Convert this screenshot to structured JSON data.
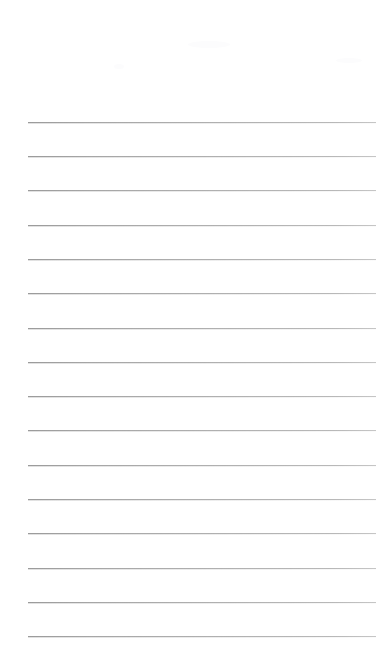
{
  "page": {
    "kind": "lined-notepad-page",
    "width": 388,
    "height": 671,
    "background_color": "#ffffff",
    "orientation": "portrait"
  },
  "header": {
    "title": "",
    "subtitle": "",
    "margin_height": 122,
    "is_blank": "true"
  },
  "ruling": {
    "line_count": 16,
    "line_color": "#a8a8a8",
    "line_thickness": 1,
    "line_left": 28,
    "line_right": 376,
    "line_width": 348,
    "first_line_y": 122,
    "line_spacing": 34.3,
    "style": "single-ruled-horizontal"
  },
  "lines": [
    {
      "index": 1,
      "y": 122,
      "text": ""
    },
    {
      "index": 2,
      "y": 156,
      "text": ""
    },
    {
      "index": 3,
      "y": 190,
      "text": ""
    },
    {
      "index": 4,
      "y": 225,
      "text": ""
    },
    {
      "index": 5,
      "y": 259,
      "text": ""
    },
    {
      "index": 6,
      "y": 293,
      "text": ""
    },
    {
      "index": 7,
      "y": 328,
      "text": ""
    },
    {
      "index": 8,
      "y": 362,
      "text": ""
    },
    {
      "index": 9,
      "y": 396,
      "text": ""
    },
    {
      "index": 10,
      "y": 430,
      "text": ""
    },
    {
      "index": 11,
      "y": 465,
      "text": ""
    },
    {
      "index": 12,
      "y": 499,
      "text": ""
    },
    {
      "index": 13,
      "y": 533,
      "text": ""
    },
    {
      "index": 14,
      "y": 568,
      "text": ""
    },
    {
      "index": 15,
      "y": 602,
      "text": ""
    },
    {
      "index": 16,
      "y": 636,
      "text": ""
    }
  ],
  "footer": {
    "text": "",
    "is_blank": "true"
  }
}
